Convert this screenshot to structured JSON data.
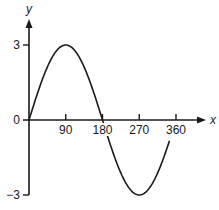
{
  "chart_data": {
    "type": "line",
    "title": "",
    "xlabel": "x",
    "ylabel": "y",
    "x_ticks": [
      90,
      180,
      270,
      360
    ],
    "y_ticks": [
      3,
      0,
      -3
    ],
    "y_tick_labels": [
      "3",
      "0",
      "−3"
    ],
    "x_tick_labels": [
      "90",
      "180",
      "270",
      "360"
    ],
    "xlim": [
      0,
      360
    ],
    "ylim": [
      -3,
      3
    ],
    "grid": false,
    "legend": null,
    "series": [
      {
        "name": "y = 3 sin x",
        "function": "3*sin(x deg)",
        "x": [
          0,
          30,
          60,
          90,
          120,
          150,
          180,
          210,
          240,
          270,
          300,
          330,
          360
        ],
        "values": [
          0,
          1.5,
          2.6,
          3,
          2.6,
          1.5,
          0,
          -1.5,
          -2.6,
          -3,
          -2.6,
          -1.5,
          0
        ]
      }
    ],
    "layout": {
      "origin_px": [
        29,
        120
      ],
      "px_per_degree": 0.4083,
      "px_per_unit_y": 25,
      "x_axis_end_px": 206,
      "y_axis_top_px": 19,
      "y_axis_bottom_px": 195
    }
  },
  "axes": {
    "x_label": "x",
    "y_label": "y",
    "origin_label": "0"
  }
}
